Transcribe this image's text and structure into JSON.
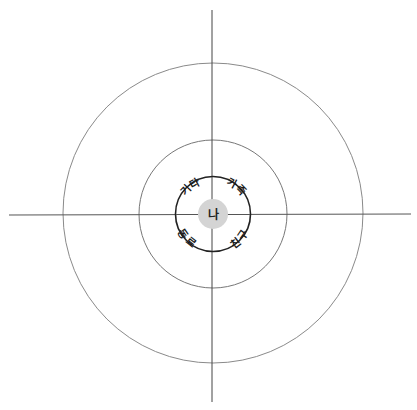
{
  "diagram": {
    "title": "",
    "type": "concentric-relationship-circles",
    "center_label": "나",
    "quadrant_labels": {
      "top_left": "기타",
      "top_right": "가족",
      "bottom_left": "동료",
      "bottom_right": "친구"
    },
    "rings": [
      "inner",
      "middle",
      "outer"
    ],
    "colors": {
      "background": "#ffffff",
      "axis": "#444444",
      "outer_ring": "#888888",
      "middle_ring": "#777777",
      "inner_ring": "#222222",
      "center_fill": "#d4d4d4",
      "text": "#1a1a1a"
    }
  }
}
